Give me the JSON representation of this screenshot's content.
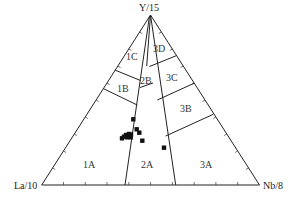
{
  "diagram": {
    "type": "ternary",
    "apices": {
      "top": "Y/15",
      "left": "La/10",
      "right": "Nb/8"
    },
    "regions": [
      "1A",
      "1B",
      "1C",
      "2A",
      "2B",
      "3A",
      "3B",
      "3C",
      "3D"
    ],
    "colors": {
      "line": "#222222",
      "point": "#111111",
      "text": "#333333"
    }
  },
  "labels": {
    "top": "Y/15",
    "left": "La/10",
    "right": "Nb/8",
    "r1A": "1A",
    "r1B": "1B",
    "r1C": "1C",
    "r2A": "2A",
    "r2B": "2B",
    "r3A": "3A",
    "r3B": "3B",
    "r3C": "3C",
    "r3D": "3D"
  },
  "samples": [
    {
      "x": 133.3,
      "y": 119.3
    },
    {
      "x": 136.7,
      "y": 129.3
    },
    {
      "x": 139.3,
      "y": 132.7
    },
    {
      "x": 126.0,
      "y": 135.0
    },
    {
      "x": 124.0,
      "y": 136.7
    },
    {
      "x": 122.0,
      "y": 138.3
    },
    {
      "x": 127.3,
      "y": 137.3
    },
    {
      "x": 130.7,
      "y": 137.3
    },
    {
      "x": 142.3,
      "y": 140.7
    },
    {
      "x": 164.0,
      "y": 147.7
    },
    {
      "x": 129.0,
      "y": 134.0
    },
    {
      "x": 131.0,
      "y": 134.5
    }
  ]
}
